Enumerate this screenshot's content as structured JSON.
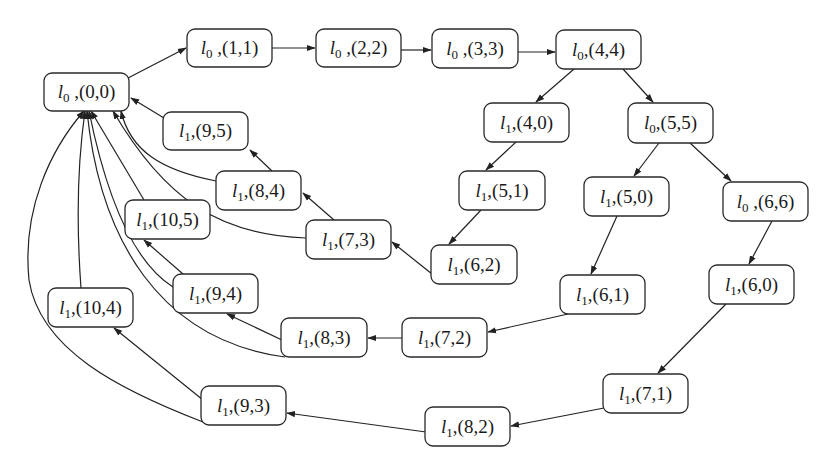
{
  "diagram": {
    "type": "state-transition-graph",
    "colors": {
      "stroke": "#222222",
      "text": "#1a1a1a",
      "background": "#ffffff"
    },
    "nodes": [
      {
        "id": "n00",
        "loc": "l",
        "sub": "0",
        "sep": " ,",
        "state": "(0,0)",
        "x": 44,
        "y": 73,
        "w": 85,
        "h": 38
      },
      {
        "id": "n11",
        "loc": "l",
        "sub": "0",
        "sep": " ,",
        "state": "(1,1)",
        "x": 187,
        "y": 29,
        "w": 85,
        "h": 38
      },
      {
        "id": "n22",
        "loc": "l",
        "sub": "0",
        "sep": " ,",
        "state": "(2,2)",
        "x": 316,
        "y": 29,
        "w": 85,
        "h": 38
      },
      {
        "id": "n33",
        "loc": "l",
        "sub": "0",
        "sep": " ,",
        "state": "(3,3)",
        "x": 432,
        "y": 29,
        "w": 86,
        "h": 39
      },
      {
        "id": "n44",
        "loc": "l",
        "sub": "0",
        "sep": ",",
        "state": "(4,4)",
        "x": 556,
        "y": 30,
        "w": 85,
        "h": 39
      },
      {
        "id": "n40",
        "loc": "l",
        "sub": "1",
        "sep": ",",
        "state": "(4,0)",
        "x": 484,
        "y": 103,
        "w": 85,
        "h": 39
      },
      {
        "id": "n55",
        "loc": "l",
        "sub": "0",
        "sep": ",",
        "state": "(5,5)",
        "x": 628,
        "y": 103,
        "w": 85,
        "h": 40
      },
      {
        "id": "n51",
        "loc": "l",
        "sub": "1",
        "sep": ",",
        "state": "(5,1)",
        "x": 459,
        "y": 171,
        "w": 86,
        "h": 39
      },
      {
        "id": "n50",
        "loc": "l",
        "sub": "1",
        "sep": ",",
        "state": "(5,0)",
        "x": 584,
        "y": 177,
        "w": 85,
        "h": 39
      },
      {
        "id": "n66",
        "loc": "l",
        "sub": "0",
        "sep": " ,",
        "state": "(6,6)",
        "x": 723,
        "y": 182,
        "w": 85,
        "h": 39
      },
      {
        "id": "n62",
        "loc": "l",
        "sub": "1",
        "sep": ",",
        "state": "(6,2)",
        "x": 431,
        "y": 245,
        "w": 86,
        "h": 39
      },
      {
        "id": "n61",
        "loc": "l",
        "sub": "1",
        "sep": ",",
        "state": "(6,1)",
        "x": 560,
        "y": 275,
        "w": 85,
        "h": 39
      },
      {
        "id": "n60",
        "loc": "l",
        "sub": "1",
        "sep": ",",
        "state": "(6,0)",
        "x": 709,
        "y": 265,
        "w": 85,
        "h": 39
      },
      {
        "id": "n95",
        "loc": "l",
        "sub": "1",
        "sep": ",",
        "state": "(9,5)",
        "x": 163,
        "y": 112,
        "w": 85,
        "h": 38
      },
      {
        "id": "n84",
        "loc": "l",
        "sub": "1",
        "sep": ",",
        "state": "(8,4)",
        "x": 216,
        "y": 171,
        "w": 85,
        "h": 39
      },
      {
        "id": "n73",
        "loc": "l",
        "sub": "1",
        "sep": ",",
        "state": "(7,3)",
        "x": 306,
        "y": 220,
        "w": 85,
        "h": 39
      },
      {
        "id": "n105",
        "loc": "l",
        "sub": "1",
        "sep": ",",
        "state": "(10,5)",
        "x": 125,
        "y": 200,
        "w": 85,
        "h": 39
      },
      {
        "id": "n94",
        "loc": "l",
        "sub": "1",
        "sep": ",",
        "state": "(9,4)",
        "x": 173,
        "y": 274,
        "w": 85,
        "h": 39
      },
      {
        "id": "n83",
        "loc": "l",
        "sub": "1",
        "sep": ",",
        "state": "(8,3)",
        "x": 281,
        "y": 318,
        "w": 86,
        "h": 39
      },
      {
        "id": "n72",
        "loc": "l",
        "sub": "1",
        "sep": ",",
        "state": "(7,2)",
        "x": 402,
        "y": 318,
        "w": 85,
        "h": 39
      },
      {
        "id": "n104",
        "loc": "l",
        "sub": "1",
        "sep": ",",
        "state": "(10,4)",
        "x": 48,
        "y": 288,
        "w": 85,
        "h": 39
      },
      {
        "id": "n93",
        "loc": "l",
        "sub": "1",
        "sep": ",",
        "state": "(9,3)",
        "x": 201,
        "y": 386,
        "w": 85,
        "h": 39
      },
      {
        "id": "n71",
        "loc": "l",
        "sub": "1",
        "sep": ",",
        "state": "(7,1)",
        "x": 603,
        "y": 374,
        "w": 85,
        "h": 39
      },
      {
        "id": "n82",
        "loc": "l",
        "sub": "1",
        "sep": ",",
        "state": "(8,2)",
        "x": 425,
        "y": 407,
        "w": 85,
        "h": 39
      }
    ],
    "edges": [
      {
        "from": "(0,0)",
        "to": "(1,1)",
        "d": "M 128 78 L 186 48"
      },
      {
        "from": "(1,1)",
        "to": "(2,2)",
        "d": "M 272 48 L 315 48"
      },
      {
        "from": "(2,2)",
        "to": "(3,3)",
        "d": "M 401 50 L 431 50"
      },
      {
        "from": "(3,3)",
        "to": "(4,4)",
        "d": "M 518 52 L 555 52"
      },
      {
        "from": "(4,4)",
        "to": "(4,0)",
        "d": "M 574 69 L 536 102"
      },
      {
        "from": "(4,4)",
        "to": "(5,5)",
        "d": "M 623 69 L 653 102"
      },
      {
        "from": "(4,0)",
        "to": "(5,1)",
        "d": "M 516 142 L 486 170"
      },
      {
        "from": "(5,5)",
        "to": "(5,0)",
        "d": "M 659 143 L 634 176"
      },
      {
        "from": "(5,5)",
        "to": "(6,6)",
        "d": "M 690 143 L 731 181"
      },
      {
        "from": "(5,1)",
        "to": "(6,2)",
        "d": "M 481 210 L 449 244"
      },
      {
        "from": "(5,0)",
        "to": "(6,1)",
        "d": "M 617 216 L 591 274"
      },
      {
        "from": "(6,6)",
        "to": "(6,0)",
        "d": "M 772 221 L 749 264"
      },
      {
        "from": "(6,2)",
        "to": "(7,3)",
        "d": "M 432 274 L 392 242"
      },
      {
        "from": "(6,1)",
        "to": "(7,2)",
        "d": "M 568 314 L 488 332"
      },
      {
        "from": "(6,0)",
        "to": "(7,1)",
        "d": "M 726 304 L 658 373"
      },
      {
        "from": "(7,3)",
        "to": "(8,4)",
        "d": "M 334 220 L 303 193"
      },
      {
        "from": "(7,2)",
        "to": "(8,3)",
        "d": "M 402 338 L 368 338"
      },
      {
        "from": "(7,1)",
        "to": "(8,2)",
        "d": "M 604 408 L 511 426"
      },
      {
        "from": "(8,4)",
        "to": "(9,5)",
        "d": "M 272 171 L 250 150"
      },
      {
        "from": "(8,3)",
        "to": "(9,4)",
        "d": "M 282 340 L 227 314"
      },
      {
        "from": "(8,2)",
        "to": "(9,3)",
        "d": "M 426 432 L 287 413"
      },
      {
        "from": "(9,5)",
        "to": "(0,0)",
        "d": "M 164 118 L 131 98"
      },
      {
        "from": "(9,4)",
        "to": "(10,5)",
        "d": "M 183 274 L 144 240"
      },
      {
        "from": "(9,3)",
        "to": "(10,4)",
        "d": "M 203 400 L 114 328"
      },
      {
        "from": "(8,4)",
        "to": "(0,0)",
        "d": "M 216 181 C 160 170, 130 150, 121 111"
      },
      {
        "from": "(7,3)",
        "to": "(0,0)",
        "d": "M 306 238 C 220 235, 165 200, 113 111"
      },
      {
        "from": "(10,5)",
        "to": "(0,0)",
        "d": "M 144 200 L 91 111"
      },
      {
        "from": "(9,4)",
        "to": "(0,0)",
        "d": "M 173 287 C 130 260, 105 190, 89 111"
      },
      {
        "from": "(8,3)",
        "to": "(0,0)",
        "d": "M 285 357 C 160 340, 100 240, 87 111"
      },
      {
        "from": "(10,4)",
        "to": "(0,0)",
        "d": "M 81 288 C 76 220, 78 160, 85 111"
      },
      {
        "from": "(9,3)",
        "to": "(0,0)",
        "d": "M 203 422 C 120 390, 40 350, 29 280 C 22 210, 50 150, 84 111"
      }
    ]
  }
}
